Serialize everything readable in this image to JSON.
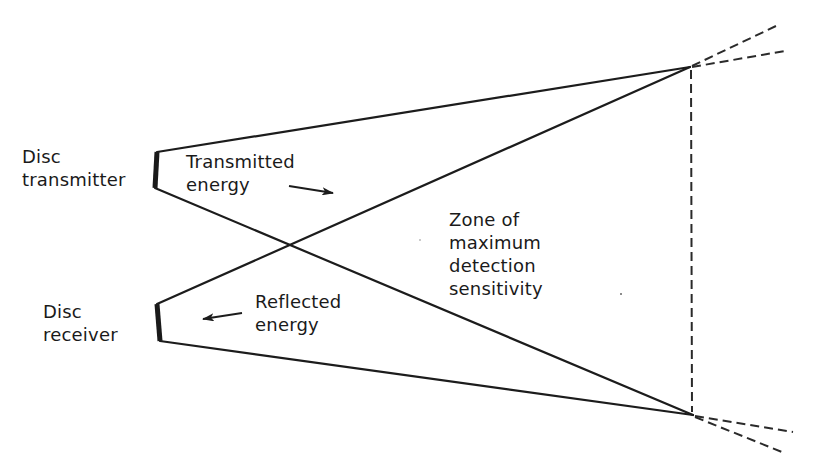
{
  "diagram": {
    "type": "transmitter-receiver detection zone schematic",
    "colors": {
      "line": "#1c1c1c",
      "background": "#ffffff"
    },
    "labels": {
      "transmitter": {
        "line1": "Disc",
        "line2": "transmitter"
      },
      "receiver": {
        "line1": "Disc",
        "line2": "receiver"
      },
      "transmitted_energy": {
        "line1": "Transmitted",
        "line2": "energy"
      },
      "reflected_energy": {
        "line1": "Reflected",
        "line2": "energy"
      },
      "zone": {
        "line1": "Zone of",
        "line2": "maximum",
        "line3": "detection",
        "line4": "sensitivity"
      }
    },
    "components": {
      "transmitter_disc": {
        "x1": 157,
        "y1": 152,
        "x2": 155,
        "y2": 188
      },
      "receiver_disc": {
        "x1": 157,
        "y1": 304,
        "x2": 160,
        "y2": 341
      },
      "top_apex": {
        "x": 690,
        "y": 67
      },
      "bottom_apex": {
        "x": 693,
        "y": 415
      },
      "beam_crossing": {
        "x": 290,
        "y": 245
      }
    },
    "arrows": [
      {
        "name": "transmitted-arrow",
        "direction": "right"
      },
      {
        "name": "reflected-arrow",
        "direction": "left"
      }
    ]
  }
}
